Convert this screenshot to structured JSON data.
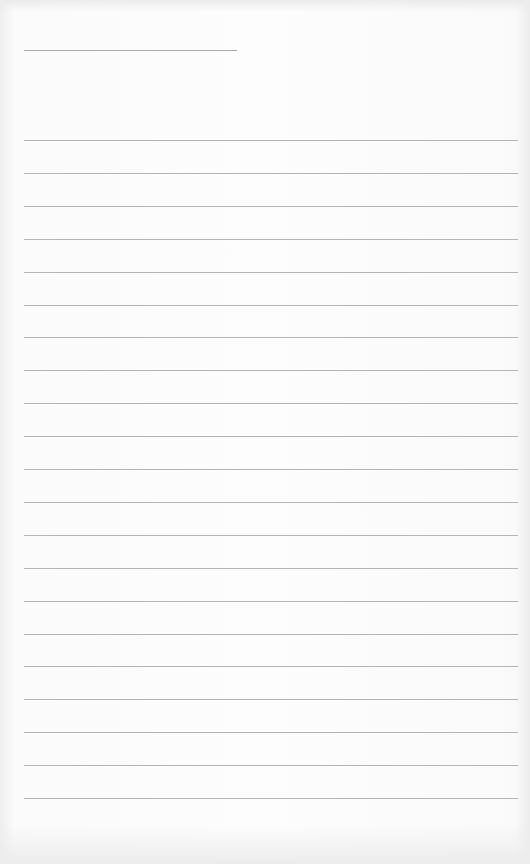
{
  "page": {
    "type": "lined-paper",
    "title_line_count": 1,
    "ruled_line_count": 21,
    "line_color": "#b4b4b4",
    "paper_color": "#fdfdfd"
  }
}
